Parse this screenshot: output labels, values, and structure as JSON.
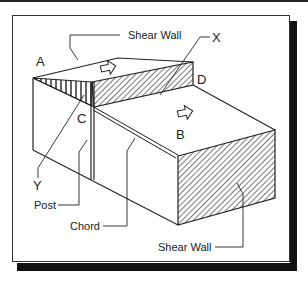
{
  "diagram": {
    "labels": {
      "shear_wall_top": "Shear Wall",
      "shear_wall_bottom": "Shear Wall",
      "post": "Post",
      "chord": "Chord",
      "point_a": "A",
      "point_b": "B",
      "point_c": "C",
      "point_d": "D",
      "point_x": "X",
      "point_y": "Y"
    },
    "colors": {
      "line": "#222222",
      "hatch": "#333333",
      "background": "#ffffff",
      "shadow": "#111111"
    }
  }
}
